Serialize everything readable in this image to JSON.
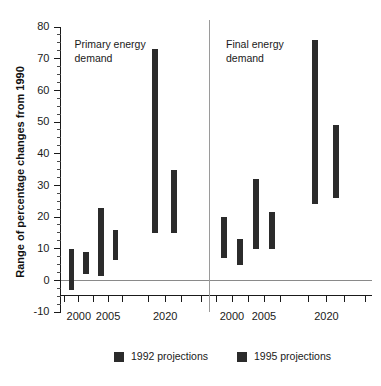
{
  "chart_data": {
    "type": "bar",
    "title": "",
    "subtitle": "",
    "xlabel": "",
    "ylabel": "Range of percentage changes from 1990",
    "ylim": [
      -10,
      80
    ],
    "y_major_ticks": [
      -10,
      0,
      10,
      20,
      30,
      40,
      50,
      60,
      70,
      80
    ],
    "y_minor_tick_interval": 2.5,
    "y_tick_labels": [
      "-10",
      "0",
      "10",
      "20",
      "30",
      "40",
      "50",
      "60",
      "70",
      "80"
    ],
    "grid": false,
    "legend_position": "bottom",
    "legend": [
      {
        "name": "1992 projections",
        "color": "#2b2b2b"
      },
      {
        "name": "1995 projections",
        "color": "#2b2b2b"
      }
    ],
    "panels": [
      {
        "label": "Primary energy demand",
        "label_line1": "Primary energy",
        "label_line2": "demand",
        "x_tick_labels": [
          "2000",
          "2005",
          "2020"
        ],
        "bars": [
          {
            "year": "2000",
            "series": "1992 projections",
            "low": -3,
            "high": 10
          },
          {
            "year": "2000",
            "series": "1995 projections",
            "low": 2,
            "high": 9
          },
          {
            "year": "2005",
            "series": "1992 projections",
            "low": 1.5,
            "high": 23
          },
          {
            "year": "2005",
            "series": "1995 projections",
            "low": 6.5,
            "high": 16
          },
          {
            "year": "2020",
            "series": "1992 projections",
            "low": 15,
            "high": 73
          },
          {
            "year": "2020",
            "series": "1995 projections",
            "low": 15,
            "high": 35
          }
        ]
      },
      {
        "label": "Final energy demand",
        "label_line1": "Final energy",
        "label_line2": "demand",
        "x_tick_labels": [
          "2000",
          "2005",
          "2020"
        ],
        "bars": [
          {
            "year": "2000",
            "series": "1992 projections",
            "low": 7,
            "high": 20
          },
          {
            "year": "2000",
            "series": "1995 projections",
            "low": 5,
            "high": 13
          },
          {
            "year": "2005",
            "series": "1992 projections",
            "low": 10,
            "high": 32
          },
          {
            "year": "2005",
            "series": "1995 projections",
            "low": 10,
            "high": 21.5
          },
          {
            "year": "2020",
            "series": "1992 projections",
            "low": 24,
            "high": 76
          },
          {
            "year": "2020",
            "series": "1995 projections",
            "low": 26,
            "high": 49
          }
        ]
      }
    ],
    "colors": {
      "bar": "#2b2b2b",
      "axis": "#1a1a1a",
      "zero_line": "#8a8a8a",
      "divider": "#9a9a9a",
      "background": "#ffffff"
    }
  }
}
